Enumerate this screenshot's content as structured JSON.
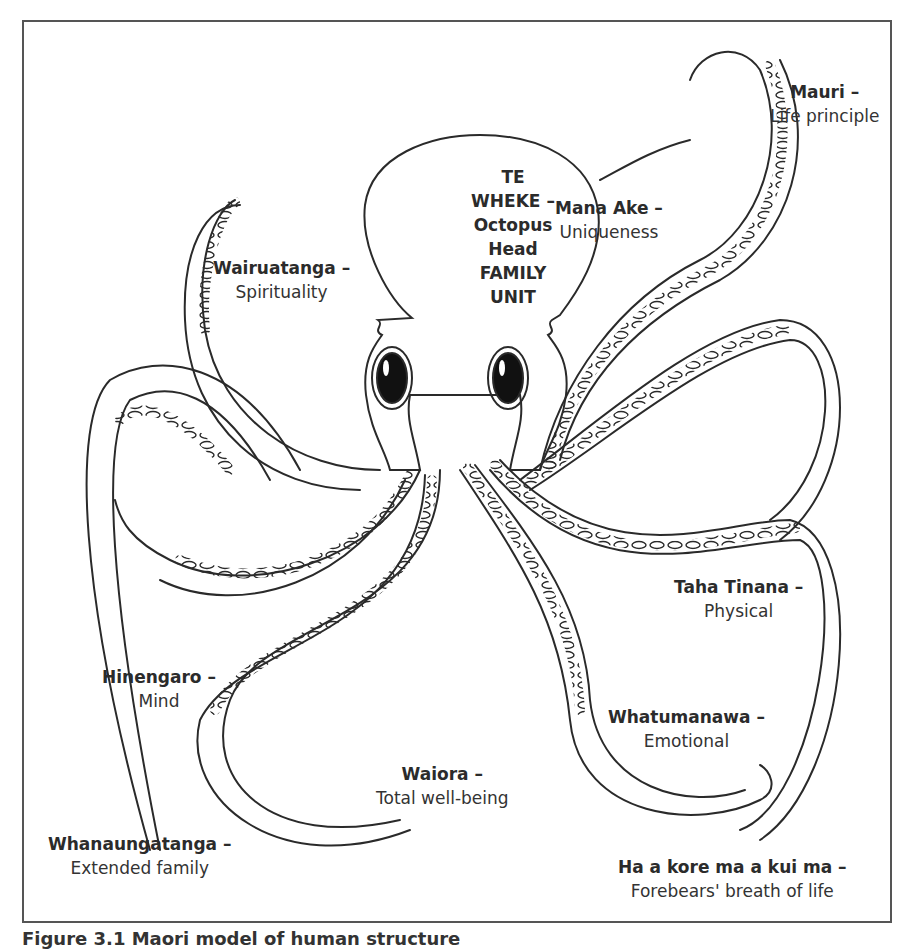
{
  "figure": {
    "head": {
      "lines": [
        "TE",
        "WHEKE –",
        "Octopus",
        "Head",
        "FAMILY",
        "UNIT"
      ]
    },
    "labels": [
      {
        "id": "mauri",
        "title": "Mauri –",
        "desc": "Life principle"
      },
      {
        "id": "mana-ake",
        "title": "Mana Ake –",
        "desc": "Uniqueness"
      },
      {
        "id": "wairuatanga",
        "title": "Wairuatanga –",
        "desc": "Spirituality"
      },
      {
        "id": "taha-tinana",
        "title": "Taha Tinana –",
        "desc": "Physical"
      },
      {
        "id": "hinengaro",
        "title": "Hinengaro –",
        "desc": "Mind"
      },
      {
        "id": "whatumanawa",
        "title": "Whatumanawa –",
        "desc": "Emotional"
      },
      {
        "id": "waiora",
        "title": "Waiora –",
        "desc": "Total well-being"
      },
      {
        "id": "whanaungatanga",
        "title": "Whanaungatanga –",
        "desc": "Extended family"
      },
      {
        "id": "ha-a-kore",
        "title": "Ha a kore ma a kui ma –",
        "desc": "Forebears' breath of life"
      }
    ],
    "caption": "Figure 3.1  Maori model of human structure",
    "colors": {
      "line": "#2a2a2a",
      "frame": "#555555",
      "eye": "#111111"
    }
  }
}
